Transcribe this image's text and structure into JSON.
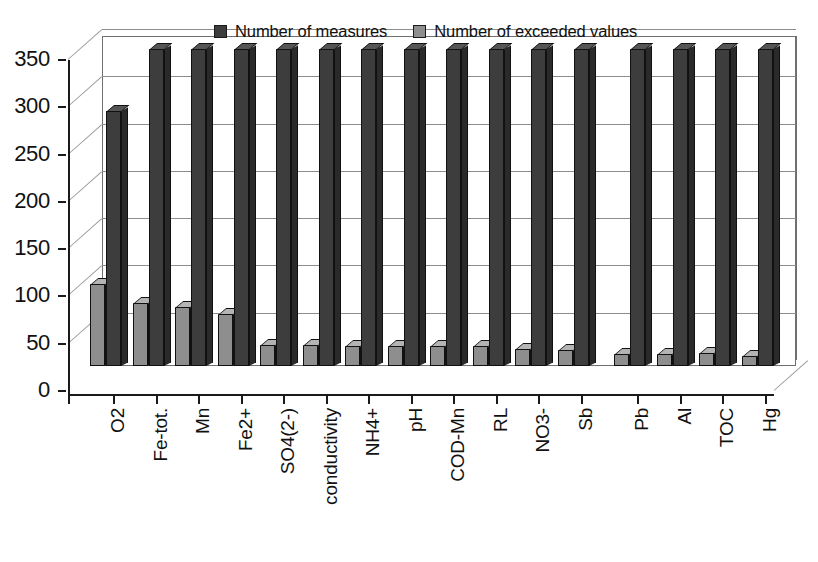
{
  "chart_data": {
    "type": "bar",
    "title": "",
    "subtitle": "",
    "xlabel": "",
    "ylabel": "",
    "ylim": [
      0,
      350
    ],
    "yticks": [
      0,
      50,
      100,
      150,
      200,
      250,
      300,
      350
    ],
    "grid": true,
    "legend_position": "top-center",
    "style": "3d-clustered-column",
    "group_gap_after": "Sb",
    "categories": [
      "O2",
      "Fe-tot.",
      "Mn",
      "Fe2+",
      "SO4(2-)",
      "conductivity",
      "NH4+",
      "pH",
      "COD-Mn",
      "RL",
      "NO3-",
      "Sb",
      "Pb",
      "Al",
      "TOC",
      "Hg"
    ],
    "series": [
      {
        "name": "Number of measures",
        "color": "#3d3d3d",
        "values": [
          270,
          335,
          335,
          335,
          335,
          335,
          335,
          335,
          335,
          335,
          335,
          335,
          335,
          335,
          335,
          335
        ]
      },
      {
        "name": "Number of exceeded values",
        "color": "#8e8e8e",
        "values": [
          87,
          67,
          62,
          55,
          22,
          22,
          21,
          21,
          21,
          21,
          18,
          17,
          13,
          13,
          14,
          11
        ]
      }
    ]
  },
  "legend": {
    "entries": [
      {
        "label": "Number of measures",
        "swatch": "series-dark"
      },
      {
        "label": "Number of exceeded values",
        "swatch": "series-light"
      }
    ]
  }
}
